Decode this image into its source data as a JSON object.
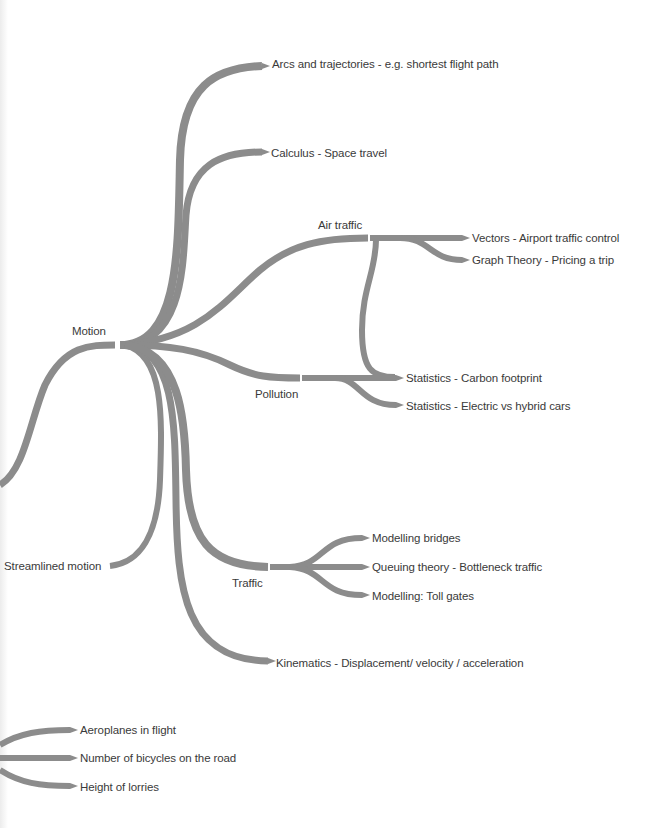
{
  "diagram": {
    "type": "mind-map",
    "colors": {
      "branch": "#8c8c8c",
      "text": "#3a3a3a",
      "background": "#ffffff"
    },
    "root": "Motion",
    "nodes": {
      "motion": "Motion",
      "arcs": "Arcs and trajectories - e.g. shortest flight path",
      "calculus": "Calculus - Space travel",
      "air_traffic": "Air traffic",
      "vectors": "Vectors - Airport traffic control",
      "graph_theory": "Graph Theory - Pricing a trip",
      "pollution": "Pollution",
      "carbon": "Statistics - Carbon footprint",
      "electric": "Statistics - Electric vs hybrid cars",
      "streamlined": "Streamlined motion",
      "traffic": "Traffic",
      "bridges": "Modelling bridges",
      "queuing": "Queuing theory - Bottleneck traffic",
      "toll": "Modelling: Toll gates",
      "kinematics": "Kinematics - Displacement/ velocity / acceleration",
      "aeroplanes": "Aeroplanes in flight",
      "bicycles": "Number of bicycles on the road",
      "lorries": "Height of lorries"
    }
  }
}
